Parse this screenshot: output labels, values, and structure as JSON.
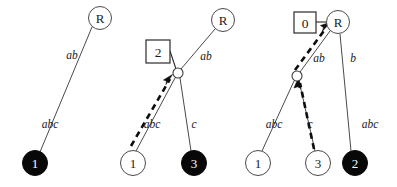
{
  "figure": {
    "title": "",
    "background_color": "#ffffff",
    "width": 397,
    "height": 187,
    "panels": [
      {
        "id": "panel-1",
        "nodes": [
          {
            "id": "p1-R",
            "label": "R",
            "shape": "circle",
            "fill": "open",
            "cx": 100,
            "cy": 18,
            "r": 11.5
          },
          {
            "id": "p1-1",
            "label": "1",
            "shape": "circle",
            "fill": "filled",
            "cx": 35,
            "cy": 163,
            "r": 12.5
          }
        ],
        "edges": [
          {
            "id": "p1-e1",
            "from": "p1-1",
            "to": "p1-R",
            "label": "ab",
            "label_x": 72,
            "label_y": 55
          },
          {
            "id": "p1-e2",
            "from": "p1-1",
            "to": "p1-R",
            "label": "abc",
            "label_x": 50,
            "label_y": 124
          }
        ],
        "boxes": [],
        "dashed_paths": []
      },
      {
        "id": "panel-2",
        "nodes": [
          {
            "id": "p2-R",
            "label": "R",
            "shape": "circle",
            "fill": "open",
            "cx": 223,
            "cy": 20,
            "r": 11.5
          },
          {
            "id": "p2-1",
            "label": "1",
            "shape": "circle",
            "fill": "open",
            "cx": 133,
            "cy": 163,
            "r": 12.5
          },
          {
            "id": "p2-3",
            "label": "3",
            "shape": "circle",
            "fill": "filled",
            "cx": 194,
            "cy": 163,
            "r": 12.5
          },
          {
            "id": "p2-j",
            "label": "",
            "shape": "junction",
            "fill": "open",
            "cx": 178,
            "cy": 73,
            "r": 5
          }
        ],
        "edges": [
          {
            "id": "p2-e1",
            "from": "p2-j",
            "to": "p2-R",
            "label": "ab",
            "label_x": 206,
            "label_y": 56
          },
          {
            "id": "p2-e2",
            "from": "p2-1",
            "to": "p2-j",
            "label": "abc",
            "label_x": 152,
            "label_y": 124
          },
          {
            "id": "p2-e3",
            "from": "p2-3",
            "to": "p2-j",
            "label": "c",
            "label_x": 194,
            "label_y": 124
          }
        ],
        "boxes": [
          {
            "id": "p2-box",
            "label": "2",
            "x": 146,
            "y": 40,
            "w": 24,
            "h": 23,
            "connects_to": "p2-j"
          }
        ],
        "dashed_paths": [
          {
            "id": "p2-dash",
            "from": "p2-1",
            "to": "p2-j",
            "arrow": true
          }
        ]
      },
      {
        "id": "panel-3",
        "nodes": [
          {
            "id": "p3-R",
            "label": "R",
            "shape": "circle",
            "fill": "open",
            "cx": 338,
            "cy": 22,
            "r": 11.5
          },
          {
            "id": "p3-1",
            "label": "1",
            "shape": "circle",
            "fill": "open",
            "cx": 258,
            "cy": 163,
            "r": 12.5
          },
          {
            "id": "p3-3",
            "label": "3",
            "shape": "circle",
            "fill": "open",
            "cx": 318,
            "cy": 163,
            "r": 12.5
          },
          {
            "id": "p3-2",
            "label": "2",
            "shape": "circle",
            "fill": "filled",
            "cx": 355,
            "cy": 163,
            "r": 12.5
          },
          {
            "id": "p3-j",
            "label": "",
            "shape": "junction",
            "fill": "open",
            "cx": 297,
            "cy": 76,
            "r": 5
          }
        ],
        "edges": [
          {
            "id": "p3-e1",
            "from": "p3-j",
            "to": "p3-R",
            "label": "ab",
            "label_x": 319,
            "label_y": 58
          },
          {
            "id": "p3-e2",
            "from": "p3-2",
            "to": "p3-R",
            "label": "b",
            "label_x": 353,
            "label_y": 58
          },
          {
            "id": "p3-e3",
            "from": "p3-1",
            "to": "p3-j",
            "label": "abc",
            "label_x": 274,
            "label_y": 124
          },
          {
            "id": "p3-e4",
            "from": "p3-3",
            "to": "p3-j",
            "label": "c",
            "label_x": 310,
            "label_y": 124
          },
          {
            "id": "p3-e5",
            "from": "p3-2",
            "to": "p3-R",
            "label": "abc",
            "label_x": 370,
            "label_y": 124
          }
        ],
        "boxes": [
          {
            "id": "p3-box",
            "label": "0",
            "x": 294,
            "y": 12,
            "w": 22,
            "h": 21,
            "connects_to": "p3-R"
          }
        ],
        "dashed_paths": [
          {
            "id": "p3-dash-1",
            "from": "p3-3",
            "to": "p3-j",
            "arrow": true
          },
          {
            "id": "p3-dash-2",
            "from": "p3-j",
            "to": "p3-R",
            "arrow": true
          }
        ]
      }
    ],
    "colors": {
      "edge": "#4a4a4a",
      "node_open_fill": "#ffffff",
      "node_filled_fill": "#080808",
      "text": "#1a1a1a",
      "text_inverse": "#ffffff",
      "dashed": "#0d0d0d"
    }
  }
}
